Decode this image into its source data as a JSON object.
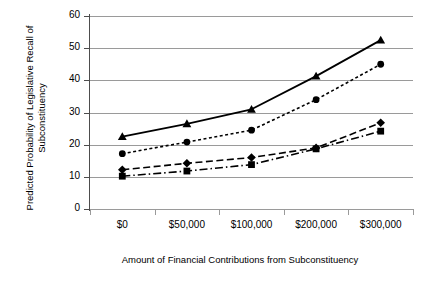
{
  "chart_data": {
    "type": "line",
    "title": "",
    "xlabel": "Amount of Financial Contributions from Subconstituency",
    "ylabel": "Predicted Probability of Legislative Recall of Subconstituency",
    "categories": [
      "$0",
      "$50,000",
      "$100,000",
      "$200,000",
      "$300,000"
    ],
    "x_values": [
      0,
      50000,
      100000,
      200000,
      300000
    ],
    "ylim": [
      0,
      60
    ],
    "ytick_values": [
      0,
      10,
      20,
      30,
      40,
      50,
      60
    ],
    "ytick_labels": [
      "0",
      "10",
      "20",
      "30",
      "40",
      "50",
      "60"
    ],
    "grid": "horizontal",
    "legend": "none",
    "series": [
      {
        "name": "series-1",
        "marker": "triangle",
        "line_style": "solid",
        "color": "#000000",
        "values": [
          22.5,
          26.5,
          31.0,
          41.3,
          52.5
        ]
      },
      {
        "name": "series-2",
        "marker": "circle",
        "line_style": "dotted",
        "color": "#000000",
        "values": [
          17.2,
          20.8,
          24.5,
          34.0,
          45.0
        ]
      },
      {
        "name": "series-3",
        "marker": "diamond",
        "line_style": "dashed",
        "color": "#000000",
        "values": [
          12.2,
          14.2,
          16.0,
          19.0,
          26.8
        ]
      },
      {
        "name": "series-4",
        "marker": "square",
        "line_style": "dash-dot",
        "color": "#000000",
        "values": [
          10.2,
          11.8,
          13.8,
          18.7,
          24.2
        ]
      }
    ]
  }
}
